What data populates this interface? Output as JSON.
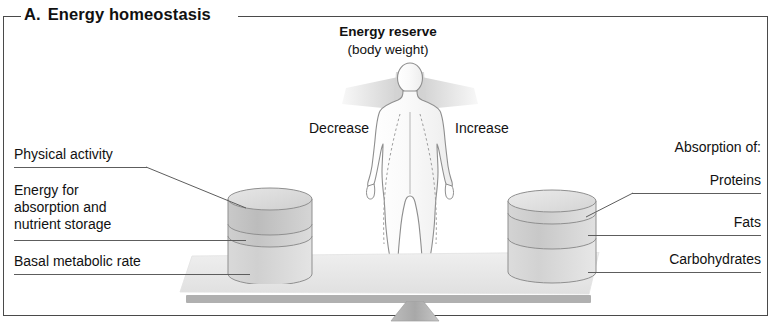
{
  "figure": {
    "panel_letter": "A.",
    "title": "Energy homeostasis"
  },
  "header": {
    "main": "Energy reserve",
    "sub": "(body weight)"
  },
  "directions": {
    "left": "Decrease",
    "right": "Increase"
  },
  "left_labels": [
    {
      "text": "Physical activity"
    },
    {
      "text": "Energy for absorption and nutrient storage"
    },
    {
      "text": "Basal metabolic rate"
    }
  ],
  "left_label_lines": {
    "l2_line1": "Energy for",
    "l2_line2": "absorption and",
    "l2_line3": "nutrient storage"
  },
  "right_labels": [
    {
      "text": "Absorption of:"
    },
    {
      "text": "Proteins"
    },
    {
      "text": "Fats"
    },
    {
      "text": "Carbohydrates"
    }
  ],
  "colors": {
    "frame": "#4a4a4a",
    "text": "#111111",
    "leader": "#5d5d5d",
    "beam": "#b0b0b0",
    "platform": "#e8e8e8",
    "cylinder_top": "#c4c4c4",
    "cylinder_mid": "#cfcfcf",
    "cylinder_bottom": "#d8d8d8",
    "person_fill": "#fbfbfb",
    "person_stroke": "#8a8a8a",
    "wedge": "#d7d7d7"
  }
}
